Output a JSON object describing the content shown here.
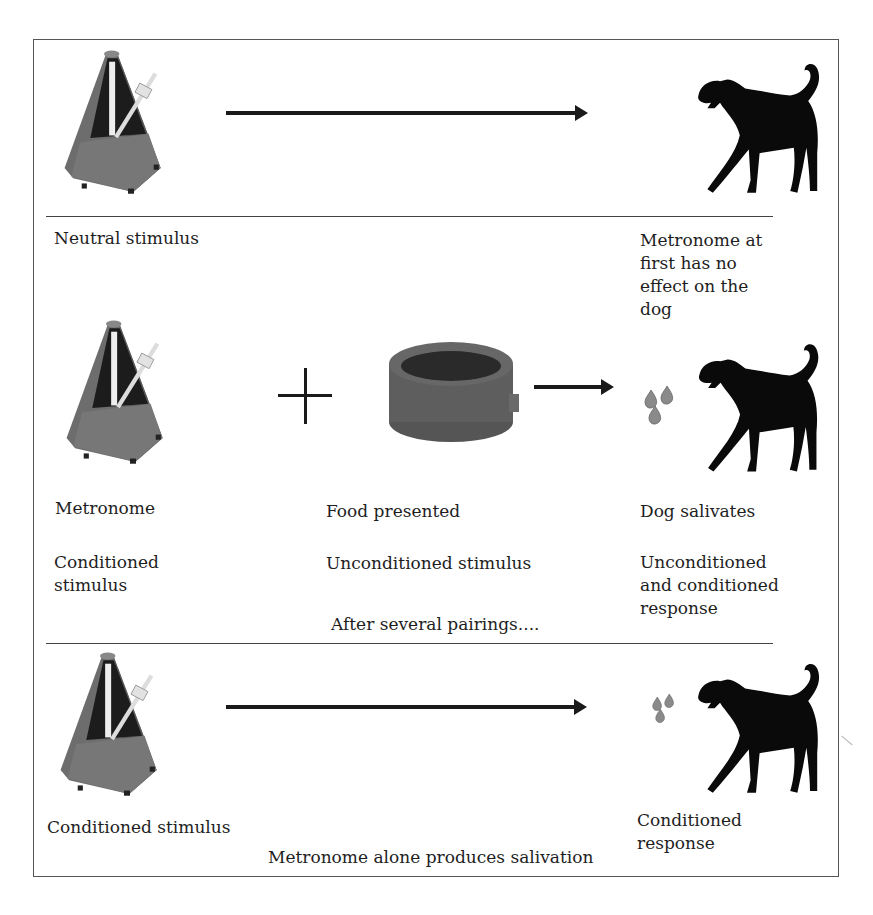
{
  "figure": {
    "colors": {
      "metronome_body": "#6a6a6a",
      "metronome_face": "#1c1c1c",
      "dog": "#0a0a0a",
      "saliva": "#8a8a8a",
      "bowl": "#5a5a5a",
      "lines": "#444444"
    }
  },
  "panels": [
    {
      "id": "before",
      "icons": [
        "metronome-icon",
        "arrow-right-icon",
        "dog-icon"
      ],
      "left_label": "Neutral stimulus",
      "right_label": "Metronome at\nfirst has no\neffect on the\ndog"
    },
    {
      "id": "during",
      "icons": [
        "metronome-icon",
        "plus-icon",
        "food-bowl-icon",
        "arrow-right-icon",
        "saliva-drops-icon",
        "dog-icon"
      ],
      "left_label": "Metronome",
      "left_sublabel": "Conditioned\nstimulus",
      "middle_label": "Food presented",
      "middle_sublabel": "Unconditioned stimulus",
      "right_label": "Dog salivates",
      "right_sublabel": "Unconditioned\nand conditioned\nresponse",
      "footer": "After several pairings...."
    },
    {
      "id": "after",
      "icons": [
        "metronome-icon",
        "arrow-right-icon",
        "saliva-drops-icon",
        "dog-icon"
      ],
      "left_label": "Conditioned stimulus",
      "middle_label": "Metronome alone produces salivation",
      "right_label": "Conditioned\nresponse"
    }
  ]
}
